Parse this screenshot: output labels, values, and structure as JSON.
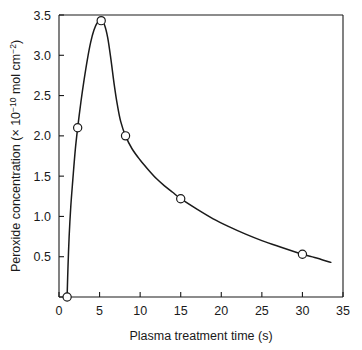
{
  "chart_data": {
    "type": "line",
    "title": "",
    "xlabel": "Plasma treatment time (s)",
    "ylabel_parts": {
      "main": "Peroxide concentration (× 10",
      "exp1": "−10",
      "mid": " mol cm",
      "exp2": "−2",
      "tail": ")"
    },
    "ylabel": "Peroxide concentration (× 10⁻¹⁰ mol cm⁻²)",
    "xlim": [
      0,
      35
    ],
    "ylim": [
      0,
      3.5
    ],
    "xticks": [
      0,
      5,
      10,
      15,
      20,
      25,
      30,
      35
    ],
    "xtick_labels": [
      "0",
      "5",
      "10",
      "15",
      "20",
      "25",
      "30",
      "35"
    ],
    "yticks": [
      0,
      0.5,
      1.0,
      1.5,
      2.0,
      2.5,
      3.0,
      3.5
    ],
    "ytick_labels": [
      "",
      "0.5",
      "1.0",
      "1.5",
      "2.0",
      "2.5",
      "3.0",
      "3.5"
    ],
    "grid": false,
    "legend": "none",
    "series": [
      {
        "name": "Peroxide concentration",
        "marker": "open-circle",
        "line_color": "#1a1a1a",
        "marker_face_color": "#ffffff",
        "x": [
          1.0,
          2.3,
          5.2,
          8.2,
          15.0,
          30.0
        ],
        "values": [
          0.0,
          2.1,
          3.43,
          2.0,
          1.22,
          0.53
        ]
      }
    ],
    "curve_points": [
      [
        1.0,
        0.0
      ],
      [
        1.1,
        0.35
      ],
      [
        1.25,
        0.75
      ],
      [
        1.45,
        1.12
      ],
      [
        1.7,
        1.45
      ],
      [
        2.0,
        1.82
      ],
      [
        2.3,
        2.1
      ],
      [
        2.7,
        2.42
      ],
      [
        3.1,
        2.7
      ],
      [
        3.5,
        2.95
      ],
      [
        3.9,
        3.16
      ],
      [
        4.3,
        3.31
      ],
      [
        4.7,
        3.4
      ],
      [
        5.2,
        3.43
      ],
      [
        5.6,
        3.38
      ],
      [
        6.0,
        3.22
      ],
      [
        6.4,
        2.95
      ],
      [
        6.8,
        2.64
      ],
      [
        7.2,
        2.38
      ],
      [
        7.6,
        2.18
      ],
      [
        8.2,
        2.0
      ],
      [
        9.0,
        1.84
      ],
      [
        10.0,
        1.7
      ],
      [
        11.0,
        1.58
      ],
      [
        12.0,
        1.47
      ],
      [
        13.0,
        1.38
      ],
      [
        14.0,
        1.3
      ],
      [
        15.0,
        1.22
      ],
      [
        17.0,
        1.09
      ],
      [
        19.0,
        0.97
      ],
      [
        21.0,
        0.87
      ],
      [
        23.0,
        0.78
      ],
      [
        25.0,
        0.7
      ],
      [
        27.0,
        0.63
      ],
      [
        30.0,
        0.53
      ],
      [
        31.5,
        0.49
      ],
      [
        33.5,
        0.43
      ]
    ],
    "axis_color": "#1a1a1a",
    "background_color": "#ffffff"
  }
}
